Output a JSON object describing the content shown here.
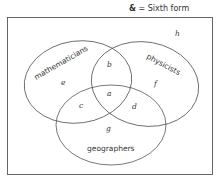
{
  "universal_set": {
    "symbol": "&",
    "label": "= Sixth form"
  },
  "sets": [
    {
      "name": "mathematicians"
    },
    {
      "name": "physicists"
    },
    {
      "name": "geographers"
    }
  ],
  "regions": {
    "a": "a",
    "b": "b",
    "c": "c",
    "d": "d",
    "e": "e",
    "f": "f",
    "g": "g",
    "h": "h"
  },
  "colors": {
    "line": "#555555",
    "text": "#333333",
    "background": "#ffffff"
  }
}
